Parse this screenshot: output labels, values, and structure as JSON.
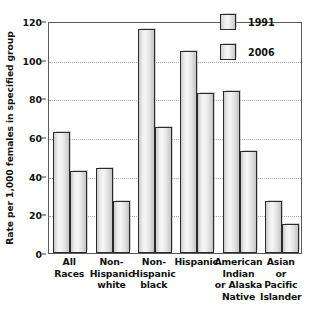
{
  "chart_data": {
    "type": "bar",
    "title": "",
    "subtitle": "",
    "xlabel": "",
    "ylabel": "Rate per 1,000 females in specified group",
    "ylim": [
      0,
      120
    ],
    "yticks": [
      0,
      20,
      40,
      60,
      80,
      100,
      120
    ],
    "ytick_labels": [
      "0",
      "20",
      "40",
      "60",
      "80",
      "100",
      "120"
    ],
    "grid": true,
    "grid_axis": "y",
    "legend_position": "top-right",
    "categories": [
      "All Races",
      "Non-Hispanic white",
      "Non-Hispanic black",
      "Hispanic",
      "American Indian or Alaska Native",
      "Asian or Pacific Islander"
    ],
    "category_lines": [
      [
        "All",
        "Races"
      ],
      [
        "Non-",
        "Hispanic",
        "white"
      ],
      [
        "Non-",
        "Hispanic",
        "black"
      ],
      [
        "Hispanic"
      ],
      [
        "American",
        "Indian",
        "or Alaska",
        "Native"
      ],
      [
        "Asian",
        "or",
        "Pacific",
        "Islander"
      ]
    ],
    "series": [
      {
        "name": "1991",
        "values": [
          62.5,
          43.8,
          116.0,
          104.5,
          84.0,
          27.0
        ]
      },
      {
        "name": "2006",
        "values": [
          42.5,
          27.0,
          65.0,
          83.0,
          53.0,
          15.0
        ]
      }
    ],
    "colors": {
      "bar_fill_light": "#f6f6f6",
      "bar_fill_dark": "#c4c4c4",
      "bar_outline": "#2b2b2b",
      "gridline": "#a8a8a8",
      "axis": "#5a5a5a",
      "text": "#111111",
      "background": "#ffffff"
    }
  },
  "legend": {
    "items": [
      {
        "label": "1991"
      },
      {
        "label": "2006"
      }
    ]
  }
}
